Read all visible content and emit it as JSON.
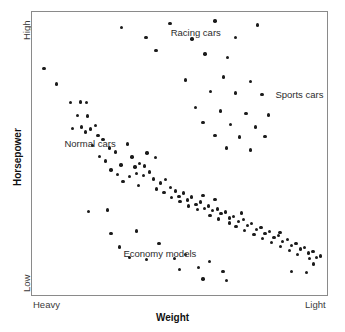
{
  "chart_data": {
    "type": "scatter",
    "title": "",
    "xlabel": "Weight",
    "ylabel": "Horsepower",
    "xlim": [
      0,
      100
    ],
    "ylim": [
      0,
      100
    ],
    "grid": false,
    "legend": "none",
    "axis_tick_labels": {
      "x_left": "Heavy",
      "x_right": "Light",
      "y_top": "High",
      "y_bottom": "Low"
    },
    "annotations": [
      {
        "text": "Racing cars",
        "x": 47.0,
        "y": 92.5
      },
      {
        "text": "Sports cars",
        "x": 82.5,
        "y": 70.5
      },
      {
        "text": "Normal cars",
        "x": 11.0,
        "y": 53.5
      },
      {
        "text": "Economy models",
        "x": 31.0,
        "y": 14.5
      }
    ],
    "series": [
      {
        "name": "Normal cars",
        "points": [
          [
            4.0,
            80.0
          ],
          [
            8.4,
            74.5
          ],
          [
            13.1,
            68.0
          ],
          [
            16.5,
            68.2
          ],
          [
            18.5,
            68.0
          ],
          [
            15.4,
            63.4
          ],
          [
            18.8,
            63.2
          ],
          [
            13.8,
            58.8
          ],
          [
            16.8,
            59.4
          ],
          [
            18.1,
            57.6
          ],
          [
            19.8,
            58.6
          ],
          [
            21.5,
            60.0
          ],
          [
            22.4,
            56.4
          ],
          [
            24.1,
            55.0
          ],
          [
            20.6,
            52.8
          ],
          [
            26.2,
            52.0
          ],
          [
            28.3,
            50.6
          ],
          [
            32.4,
            53.4
          ],
          [
            33.9,
            48.8
          ],
          [
            30.2,
            46.0
          ],
          [
            34.9,
            45.2
          ],
          [
            36.5,
            46.4
          ],
          [
            38.2,
            45.6
          ],
          [
            35.4,
            43.0
          ],
          [
            37.8,
            42.2
          ],
          [
            39.9,
            43.4
          ],
          [
            41.2,
            41.0
          ],
          [
            33.0,
            41.8
          ],
          [
            30.8,
            40.2
          ],
          [
            28.9,
            42.6
          ],
          [
            26.8,
            44.2
          ],
          [
            43.5,
            39.6
          ],
          [
            45.2,
            40.8
          ],
          [
            42.1,
            37.4
          ],
          [
            44.8,
            36.2
          ],
          [
            46.9,
            38.0
          ],
          [
            48.6,
            36.8
          ],
          [
            47.2,
            34.4
          ],
          [
            49.8,
            34.9
          ],
          [
            51.4,
            36.0
          ],
          [
            50.2,
            33.0
          ],
          [
            52.8,
            33.6
          ],
          [
            54.1,
            34.6
          ],
          [
            53.0,
            31.4
          ],
          [
            55.6,
            32.0
          ],
          [
            57.2,
            32.8
          ],
          [
            56.0,
            30.2
          ],
          [
            58.5,
            30.6
          ],
          [
            59.9,
            31.4
          ],
          [
            61.2,
            29.8
          ],
          [
            62.8,
            30.4
          ],
          [
            60.4,
            28.2
          ],
          [
            64.1,
            28.8
          ],
          [
            65.6,
            29.4
          ],
          [
            63.2,
            26.8
          ],
          [
            66.9,
            27.2
          ],
          [
            68.4,
            27.8
          ],
          [
            67.0,
            25.4
          ],
          [
            70.1,
            26.0
          ],
          [
            71.6,
            26.6
          ],
          [
            69.2,
            24.2
          ],
          [
            73.0,
            24.6
          ],
          [
            74.5,
            25.2
          ],
          [
            72.1,
            22.8
          ],
          [
            76.0,
            23.2
          ],
          [
            77.6,
            23.8
          ],
          [
            75.2,
            21.4
          ],
          [
            79.0,
            21.8
          ],
          [
            80.6,
            22.4
          ],
          [
            78.2,
            20.0
          ],
          [
            82.0,
            20.4
          ],
          [
            83.6,
            21.0
          ],
          [
            81.1,
            18.6
          ],
          [
            85.0,
            19.0
          ],
          [
            86.6,
            19.6
          ],
          [
            84.2,
            17.2
          ],
          [
            88.0,
            17.6
          ],
          [
            89.5,
            18.2
          ],
          [
            87.2,
            15.8
          ],
          [
            91.0,
            16.2
          ],
          [
            92.4,
            16.8
          ],
          [
            90.0,
            14.4
          ],
          [
            93.8,
            14.8
          ],
          [
            95.2,
            15.4
          ],
          [
            94.0,
            12.8
          ],
          [
            96.4,
            13.2
          ],
          [
            97.8,
            13.8
          ],
          [
            22.8,
            49.0
          ],
          [
            25.0,
            47.4
          ],
          [
            39.0,
            50.2
          ],
          [
            41.8,
            48.6
          ],
          [
            36.0,
            38.8
          ],
          [
            58.0,
            35.2
          ],
          [
            62.0,
            33.8
          ],
          [
            71.0,
            29.0
          ],
          [
            84.0,
            22.0
          ]
        ]
      },
      {
        "name": "Racing cars",
        "points": [
          [
            30.4,
            94.5
          ],
          [
            38.6,
            91.0
          ],
          [
            46.8,
            96.0
          ],
          [
            54.2,
            90.5
          ],
          [
            62.0,
            96.8
          ],
          [
            69.0,
            91.0
          ],
          [
            76.4,
            95.4
          ],
          [
            42.0,
            86.4
          ],
          [
            58.6,
            85.2
          ],
          [
            66.2,
            84.0
          ]
        ]
      },
      {
        "name": "Sports cars",
        "points": [
          [
            52.0,
            76.0
          ],
          [
            65.0,
            77.0
          ],
          [
            74.0,
            75.5
          ],
          [
            60.5,
            72.0
          ],
          [
            69.0,
            71.4
          ],
          [
            78.0,
            70.8
          ],
          [
            55.5,
            66.2
          ],
          [
            63.8,
            65.0
          ],
          [
            72.5,
            64.2
          ],
          [
            80.2,
            63.6
          ],
          [
            58.0,
            61.0
          ],
          [
            67.2,
            60.2
          ],
          [
            75.8,
            59.4
          ],
          [
            62.0,
            56.4
          ],
          [
            70.4,
            55.8
          ],
          [
            79.0,
            56.0
          ],
          [
            66.0,
            52.0
          ],
          [
            74.0,
            51.2
          ]
        ]
      },
      {
        "name": "Economy models",
        "points": [
          [
            19.2,
            29.6
          ],
          [
            25.6,
            30.0
          ],
          [
            26.8,
            21.8
          ],
          [
            35.4,
            22.6
          ],
          [
            29.6,
            17.0
          ],
          [
            43.0,
            18.2
          ],
          [
            33.0,
            13.2
          ],
          [
            38.8,
            12.6
          ],
          [
            48.2,
            13.0
          ],
          [
            52.0,
            14.4
          ],
          [
            56.4,
            9.8
          ],
          [
            60.2,
            11.8
          ],
          [
            64.8,
            8.2
          ],
          [
            58.0,
            5.6
          ],
          [
            66.0,
            5.2
          ],
          [
            50.0,
            9.0
          ],
          [
            88.0,
            8.4
          ],
          [
            93.0,
            8.0
          ],
          [
            95.5,
            11.0
          ]
        ]
      }
    ]
  }
}
